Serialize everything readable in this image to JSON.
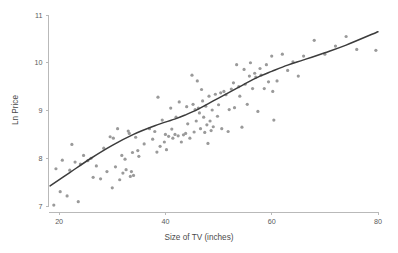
{
  "chart_data": {
    "type": "scatter",
    "title": "",
    "subtitle": "",
    "xlabel": "Size of TV (inches)",
    "ylabel": "Ln Price",
    "xlim": [
      18,
      80
    ],
    "ylim": [
      7,
      11
    ],
    "xticks": [
      20,
      40,
      60,
      80
    ],
    "yticks": [
      7,
      8,
      9,
      10,
      11
    ],
    "xtick_labels": [
      "20",
      "40",
      "60",
      "80"
    ],
    "ytick_labels": [
      "7",
      "8",
      "9",
      "10",
      "11"
    ],
    "grid": false,
    "legend": null,
    "legend_position": "none",
    "annotations": [],
    "marker_color": "#9a9a9a",
    "marker_size": 1.6,
    "line_color": "#3c3c3c",
    "axis_color": "#b9b9b9",
    "background_color": "#ffffff",
    "series": [
      {
        "name": "observations",
        "type": "scatter",
        "points": [
          [
            19.0,
            7.02
          ],
          [
            19.4,
            7.78
          ],
          [
            20.2,
            7.3
          ],
          [
            20.6,
            7.96
          ],
          [
            21.5,
            7.21
          ],
          [
            22.0,
            7.75
          ],
          [
            22.4,
            8.29
          ],
          [
            23.0,
            7.92
          ],
          [
            23.6,
            7.09
          ],
          [
            24.0,
            7.88
          ],
          [
            24.6,
            8.06
          ],
          [
            25.4,
            7.95
          ],
          [
            26.0,
            8.0
          ],
          [
            26.4,
            7.6
          ],
          [
            27.0,
            7.84
          ],
          [
            27.8,
            7.57
          ],
          [
            28.4,
            8.21
          ],
          [
            29.0,
            7.72
          ],
          [
            29.6,
            8.45
          ],
          [
            30.0,
            7.38
          ],
          [
            30.2,
            8.42
          ],
          [
            30.6,
            7.82
          ],
          [
            31.0,
            8.62
          ],
          [
            31.4,
            7.55
          ],
          [
            31.8,
            8.06
          ],
          [
            32.0,
            7.69
          ],
          [
            32.4,
            7.98
          ],
          [
            32.6,
            7.76
          ],
          [
            33.0,
            8.57
          ],
          [
            33.2,
            8.52
          ],
          [
            33.4,
            7.62
          ],
          [
            33.6,
            7.72
          ],
          [
            33.8,
            8.12
          ],
          [
            34.0,
            7.64
          ],
          [
            34.4,
            8.44
          ],
          [
            34.8,
            8.16
          ],
          [
            35.0,
            8.04
          ],
          [
            36.0,
            8.3
          ],
          [
            37.0,
            8.62
          ],
          [
            37.6,
            8.4
          ],
          [
            38.0,
            8.56
          ],
          [
            38.4,
            8.13
          ],
          [
            38.6,
            9.28
          ],
          [
            39.0,
            8.25
          ],
          [
            39.4,
            8.8
          ],
          [
            39.8,
            8.34
          ],
          [
            40.0,
            8.5
          ],
          [
            40.2,
            8.18
          ],
          [
            40.6,
            8.46
          ],
          [
            41.0,
            9.05
          ],
          [
            41.2,
            8.61
          ],
          [
            41.4,
            8.42
          ],
          [
            41.8,
            8.5
          ],
          [
            42.0,
            8.86
          ],
          [
            42.4,
            8.47
          ],
          [
            42.6,
            9.18
          ],
          [
            43.0,
            8.34
          ],
          [
            43.4,
            8.49
          ],
          [
            43.8,
            8.52
          ],
          [
            44.0,
            9.08
          ],
          [
            44.2,
            8.72
          ],
          [
            44.6,
            8.42
          ],
          [
            45.0,
            9.74
          ],
          [
            45.2,
            9.13
          ],
          [
            45.4,
            8.55
          ],
          [
            45.6,
            9.02
          ],
          [
            45.8,
            8.78
          ],
          [
            46.0,
            9.62
          ],
          [
            46.2,
            9.05
          ],
          [
            46.4,
            8.95
          ],
          [
            46.6,
            8.62
          ],
          [
            46.8,
            9.44
          ],
          [
            47.0,
            9.2
          ],
          [
            47.2,
            8.86
          ],
          [
            47.4,
            8.54
          ],
          [
            47.6,
            9.09
          ],
          [
            47.8,
            8.7
          ],
          [
            48.0,
            8.31
          ],
          [
            48.2,
            9.3
          ],
          [
            48.4,
            8.78
          ],
          [
            48.6,
            8.58
          ],
          [
            48.8,
            9.01
          ],
          [
            49.0,
            8.66
          ],
          [
            49.4,
            9.34
          ],
          [
            49.8,
            8.88
          ],
          [
            50.0,
            9.12
          ],
          [
            50.4,
            9.37
          ],
          [
            50.6,
            8.62
          ],
          [
            51.0,
            9.4
          ],
          [
            51.4,
            9.33
          ],
          [
            51.8,
            8.56
          ],
          [
            52.0,
            9.02
          ],
          [
            52.4,
            9.45
          ],
          [
            52.8,
            9.58
          ],
          [
            53.0,
            9.06
          ],
          [
            53.4,
            9.96
          ],
          [
            53.8,
            9.5
          ],
          [
            54.0,
            9.3
          ],
          [
            54.4,
            8.65
          ],
          [
            54.8,
            9.86
          ],
          [
            55.0,
            9.55
          ],
          [
            55.4,
            9.13
          ],
          [
            55.8,
            9.72
          ],
          [
            56.0,
            10.0
          ],
          [
            56.4,
            9.46
          ],
          [
            56.8,
            9.78
          ],
          [
            57.0,
            9.7
          ],
          [
            57.4,
            8.98
          ],
          [
            57.8,
            9.88
          ],
          [
            58.0,
            9.74
          ],
          [
            58.6,
            9.46
          ],
          [
            59.0,
            9.96
          ],
          [
            59.4,
            9.6
          ],
          [
            60.0,
            10.14
          ],
          [
            60.2,
            9.4
          ],
          [
            60.4,
            8.8
          ],
          [
            61.0,
            9.62
          ],
          [
            62.0,
            10.18
          ],
          [
            63.0,
            9.84
          ],
          [
            64.0,
            10.02
          ],
          [
            65.0,
            9.72
          ],
          [
            66.0,
            10.14
          ],
          [
            68.0,
            10.47
          ],
          [
            70.0,
            10.18
          ],
          [
            72.0,
            10.35
          ],
          [
            74.0,
            10.55
          ],
          [
            76.0,
            10.28
          ],
          [
            79.6,
            10.26
          ]
        ]
      },
      {
        "name": "fitted-curve",
        "type": "line",
        "points": [
          [
            18.3,
            7.42
          ],
          [
            22.0,
            7.7
          ],
          [
            26.0,
            8.0
          ],
          [
            30.0,
            8.27
          ],
          [
            34.0,
            8.5
          ],
          [
            38.0,
            8.68
          ],
          [
            42.0,
            8.83
          ],
          [
            44.0,
            8.92
          ],
          [
            46.0,
            9.02
          ],
          [
            48.0,
            9.14
          ],
          [
            50.0,
            9.26
          ],
          [
            52.0,
            9.38
          ],
          [
            54.0,
            9.5
          ],
          [
            56.0,
            9.62
          ],
          [
            58.0,
            9.73
          ],
          [
            60.0,
            9.82
          ],
          [
            63.0,
            9.95
          ],
          [
            66.0,
            10.06
          ],
          [
            70.0,
            10.21
          ],
          [
            74.0,
            10.37
          ],
          [
            80.0,
            10.65
          ]
        ]
      }
    ]
  }
}
